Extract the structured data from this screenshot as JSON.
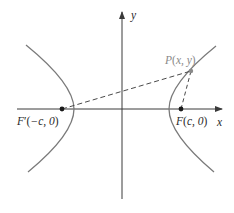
{
  "diagram": {
    "colors": {
      "axis": "#3a3a3a",
      "curve": "#7a7a7a",
      "dashed": "#4a4a4a",
      "label": "#2a2a2a",
      "point_label": "#8a8a8a"
    },
    "axes": {
      "x_label": "x",
      "y_label": "y"
    },
    "labels": {
      "focus_left": {
        "name": "F",
        "prime": "′",
        "open": "(",
        "coords": "−c, 0",
        "close": ")"
      },
      "focus_right": {
        "name": "F",
        "open": "(",
        "coords": "c, 0",
        "close": ")"
      },
      "point": {
        "name": "P",
        "open": "(",
        "coords": "x, y",
        "close": ")"
      }
    },
    "elements": [
      "left hyperbola branch",
      "right hyperbola branch",
      "dashed segment F'P",
      "dashed segment FP"
    ]
  }
}
